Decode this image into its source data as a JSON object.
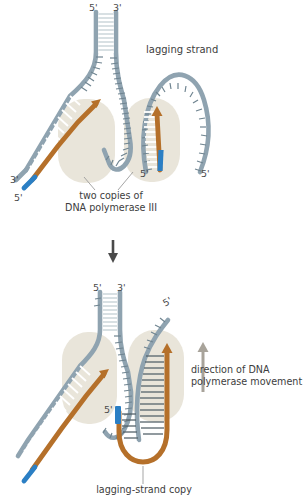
{
  "figure": {
    "title_domain": "DNA replication fork trombone model",
    "panels": [
      {
        "id": "panel-top",
        "labels": {
          "lagging_strand": "lagging strand",
          "enzyme_caption_line1": "two copies of",
          "enzyme_caption_line2": "DNA polymerase III",
          "prime_top_left": "5'",
          "prime_top_right": "3'",
          "prime_lower_left_3": "3'",
          "prime_lower_left_5": "5'",
          "prime_fork_5": "5'",
          "prime_right_5": "5'"
        }
      },
      {
        "id": "panel-bottom",
        "labels": {
          "direction_line1": "direction of DNA",
          "direction_line2": "polymerase movement",
          "lagging_strand_copy": "lagging-strand copy",
          "prime_top_left": "5'",
          "prime_top_right": "3'",
          "prime_right_5": "5'",
          "prime_loop_5": "5'"
        }
      }
    ],
    "transition": {
      "arrow": "down-arrow-icon"
    },
    "colors": {
      "template_strand": "#8fa3b0",
      "template_strand_dark": "#7e939f",
      "new_strand_brown": "#b5702a",
      "primer_blue": "#2b7fc4",
      "enzyme_blob": "#e7e3d8",
      "rung_light": "#ffffff",
      "rung_dark": "#55636b",
      "text": "#3d3d3d",
      "background": "#ffffff",
      "annotation_line": "#9b9b9b",
      "direction_arrow": "#a8a39a"
    }
  }
}
